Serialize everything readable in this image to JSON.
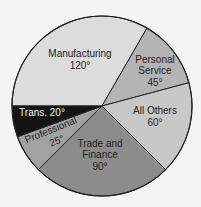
{
  "chart_data": {
    "type": "pie",
    "title": "",
    "unit": "degrees",
    "categories": [
      "Manufacturing",
      "Personal Service",
      "All Others",
      "Trade and Finance",
      "Professional",
      "Trans."
    ],
    "values": [
      120,
      45,
      60,
      90,
      25,
      20
    ],
    "labels": [
      "120°",
      "45°",
      "60°",
      "90°",
      "25°",
      "20°"
    ],
    "colors": [
      "#dcdcdc",
      "#b4b4b4",
      "#c8c8c8",
      "#8c8c8c",
      "#a2a2a2",
      "#141414"
    ],
    "legend": "none (labels inside slices)"
  },
  "slices": [
    {
      "l1": "Manufacturing",
      "l2": "",
      "v": "120°"
    },
    {
      "l1": "Personal",
      "l2": "Service",
      "v": "45°"
    },
    {
      "l1": "All Others",
      "l2": "",
      "v": "60°"
    },
    {
      "l1": "Trade and",
      "l2": "Finance",
      "v": "90°"
    },
    {
      "l1": "Professional",
      "l2": "",
      "v": "25°"
    },
    {
      "l1": "Trans. 20°",
      "l2": "",
      "v": ""
    }
  ]
}
